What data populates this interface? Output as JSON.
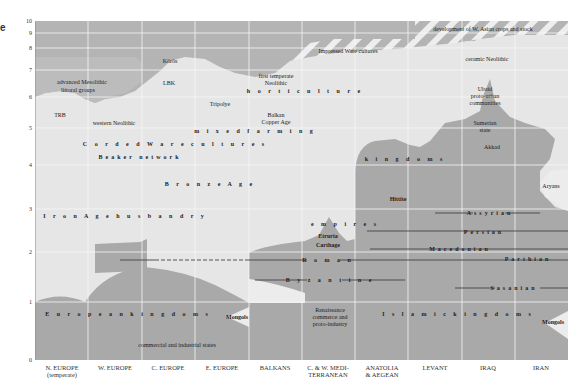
{
  "figure": {
    "letter": "e",
    "y_axis_label": "thousands of years BP",
    "y_ticks": [
      {
        "label": "10",
        "y": 21
      },
      {
        "label": "9",
        "y": 33
      },
      {
        "label": "8",
        "y": 48
      },
      {
        "label": "7",
        "y": 70
      },
      {
        "label": "6",
        "y": 97
      },
      {
        "label": "5",
        "y": 128
      },
      {
        "label": "4",
        "y": 165
      },
      {
        "label": "3",
        "y": 209
      },
      {
        "label": "2",
        "y": 252
      },
      {
        "label": "1",
        "y": 302
      },
      {
        "label": "0",
        "y": 360
      }
    ],
    "columns": [
      {
        "label": "N. EUROPE",
        "sub": "(temperate)",
        "x": 62
      },
      {
        "label": "W. EUROPE",
        "sub": "",
        "x": 115
      },
      {
        "label": "C. EUROPE",
        "sub": "",
        "x": 168
      },
      {
        "label": "E. EUROPE",
        "sub": "",
        "x": 222
      },
      {
        "label": "BALKANS",
        "sub": "",
        "x": 275
      },
      {
        "label": "C. & W. MEDI-",
        "sub": "TERRANEAN",
        "x": 328
      },
      {
        "label": "ANATOLIA",
        "sub": "& AEGEAN",
        "x": 382
      },
      {
        "label": "LEVANT",
        "sub": "",
        "x": 435
      },
      {
        "label": "IRAQ",
        "sub": "",
        "x": 488
      },
      {
        "label": "IRAN",
        "sub": "",
        "x": 541
      }
    ],
    "labels": [
      {
        "text": "Körös",
        "x": 170,
        "y": 61,
        "style": ""
      },
      {
        "text": "LBK",
        "x": 169,
        "y": 83,
        "style": ""
      },
      {
        "text": "advanced Mesolithic",
        "x": 82,
        "y": 82,
        "style": ""
      },
      {
        "text": "littoral groups",
        "x": 78,
        "y": 90,
        "style": ""
      },
      {
        "text": "TRB",
        "x": 60,
        "y": 115,
        "style": ""
      },
      {
        "text": "western Neolithic",
        "x": 114,
        "y": 123,
        "style": ""
      },
      {
        "text": "first temperate",
        "x": 276,
        "y": 76,
        "style": ""
      },
      {
        "text": "Neolithic",
        "x": 276,
        "y": 83,
        "style": ""
      },
      {
        "text": "h o r t i c u l t u r e",
        "x": 305,
        "y": 91,
        "style": "spaced-sm"
      },
      {
        "text": "Tripolye",
        "x": 220,
        "y": 104,
        "style": ""
      },
      {
        "text": "Balkan",
        "x": 276,
        "y": 115,
        "style": ""
      },
      {
        "text": "Copper Age",
        "x": 276,
        "y": 122,
        "style": ""
      },
      {
        "text": "m i x e d   f a r m i n g",
        "x": 255,
        "y": 131,
        "style": "spaced-sm"
      },
      {
        "text": "C o r d e d   W a r e   c u l t u r e s",
        "x": 175,
        "y": 144,
        "style": "spaced-sm"
      },
      {
        "text": "Beaker network",
        "x": 140,
        "y": 157,
        "style": "spaced-sm"
      },
      {
        "text": "B r o n z e   A g e",
        "x": 210,
        "y": 184,
        "style": "spaced-sm"
      },
      {
        "text": "I r o n   A g e   h u s b a n d r y",
        "x": 125,
        "y": 216,
        "style": "spaced-sm"
      },
      {
        "text": "Impressed Ware cultures",
        "x": 348,
        "y": 51,
        "style": ""
      },
      {
        "text": "development of W. Asian crops and stock",
        "x": 483,
        "y": 29,
        "style": ""
      },
      {
        "text": "ceramic Neolithic",
        "x": 487,
        "y": 59,
        "style": ""
      },
      {
        "text": "Ubaid",
        "x": 485,
        "y": 89,
        "style": ""
      },
      {
        "text": "proto-urban",
        "x": 485,
        "y": 96,
        "style": ""
      },
      {
        "text": "communities",
        "x": 485,
        "y": 103,
        "style": ""
      },
      {
        "text": "Sumerian",
        "x": 485,
        "y": 123,
        "style": ""
      },
      {
        "text": "state",
        "x": 485,
        "y": 130,
        "style": ""
      },
      {
        "text": "Akkad",
        "x": 492,
        "y": 147,
        "style": ""
      },
      {
        "text": "k i n g d o m s",
        "x": 405,
        "y": 159,
        "style": "spaced-sm"
      },
      {
        "text": "Aryans",
        "x": 551,
        "y": 186,
        "style": ""
      },
      {
        "text": "Hittite",
        "x": 398,
        "y": 199,
        "style": "bold"
      },
      {
        "text": "e m p i r e s",
        "x": 345,
        "y": 224,
        "style": "spaced-sm"
      },
      {
        "text": "Etruria",
        "x": 328,
        "y": 236,
        "style": "bold"
      },
      {
        "text": "Carthage",
        "x": 328,
        "y": 245,
        "style": "bold"
      },
      {
        "text": "R o m a n",
        "x": 328,
        "y": 260,
        "style": "spaced-sm"
      },
      {
        "text": "B y z a n t i n e",
        "x": 330,
        "y": 280,
        "style": "spaced-sm"
      },
      {
        "text": "Assyrian",
        "x": 490,
        "y": 213,
        "style": "spaced-sm"
      },
      {
        "text": "Persian",
        "x": 484,
        "y": 232,
        "style": "spaced-sm"
      },
      {
        "text": "Macedonian",
        "x": 460,
        "y": 249,
        "style": "spaced-sm"
      },
      {
        "text": "Parthian",
        "x": 528,
        "y": 259,
        "style": "spaced-sm"
      },
      {
        "text": "Sasanian",
        "x": 514,
        "y": 288,
        "style": "spaced-sm"
      },
      {
        "text": "E u r o p e a n   k i n g d o m s",
        "x": 128,
        "y": 314,
        "style": "spaced-sm"
      },
      {
        "text": "Mongols",
        "x": 237,
        "y": 317,
        "style": "bold"
      },
      {
        "text": "Renaissance",
        "x": 330,
        "y": 310,
        "style": ""
      },
      {
        "text": "commerce and",
        "x": 330,
        "y": 317,
        "style": ""
      },
      {
        "text": "proto-industry",
        "x": 330,
        "y": 324,
        "style": ""
      },
      {
        "text": "commercial and industrial states",
        "x": 177,
        "y": 345,
        "style": ""
      },
      {
        "text": "I s l a m i c   k i n g d o m s",
        "x": 458,
        "y": 314,
        "style": "spaced-sm"
      },
      {
        "text": "Mongols",
        "x": 553,
        "y": 322,
        "style": "bold"
      }
    ]
  },
  "chart_data": {
    "type": "diagram",
    "ylabel": "thousands of years BP",
    "y_ticks": [
      10,
      9,
      8,
      7,
      6,
      5,
      4,
      3,
      2,
      1,
      0
    ],
    "regions": [
      "N. EUROPE (temperate)",
      "W. EUROPE",
      "C. EUROPE",
      "E. EUROPE",
      "BALKANS",
      "C. & W. MEDITERRANEAN",
      "ANATOLIA & AEGEAN",
      "LEVANT",
      "IRAQ",
      "IRAN"
    ],
    "annotations": [
      "development of W. Asian crops and stock",
      "Impressed Ware cultures",
      "ceramic Neolithic",
      "Körös",
      "LBK",
      "advanced Mesolithic littoral groups",
      "TRB",
      "western Neolithic",
      "first temperate Neolithic horticulture",
      "Tripolye",
      "Balkan Copper Age",
      "mixed farming",
      "Corded Ware cultures",
      "Beaker network",
      "Bronze Age",
      "Iron Age husbandry",
      "Ubaid proto-urban communities",
      "Sumerian state",
      "Akkad",
      "kingdoms",
      "Hittite",
      "Aryans",
      "empires",
      "Etruria",
      "Carthage",
      "Roman",
      "Byzantine",
      "Assyrian",
      "Persian",
      "Macedonian",
      "Parthian",
      "Sasanian",
      "European kingdoms",
      "Mongols",
      "Renaissance commerce and proto-industry",
      "commercial and industrial states",
      "Islamic kingdoms"
    ]
  },
  "colors": {
    "dark_fill": "#a8a8a8",
    "light_fill": "#e8e8e8",
    "mid_fill": "#c2c2c2",
    "grid": "#f4f4f4",
    "line": "#444444"
  }
}
